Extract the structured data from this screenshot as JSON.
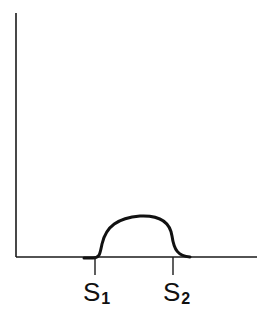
{
  "diagram": {
    "axes": {
      "origin": [
        16,
        257
      ],
      "y_top": 13,
      "x_right": 257
    },
    "curve": {
      "description": "plateau-shaped peak between S1 and S2",
      "path": "M 84 258 L 93 258 C 100 258, 100 253, 102 244 C 106 226, 118 218, 140 216 C 160 215, 170 222, 172 236 C 174 250, 178 256, 190 257"
    },
    "markers": [
      {
        "name": "S",
        "subscript": "1",
        "x": 95
      },
      {
        "name": "S",
        "subscript": "2",
        "x": 173
      }
    ]
  }
}
